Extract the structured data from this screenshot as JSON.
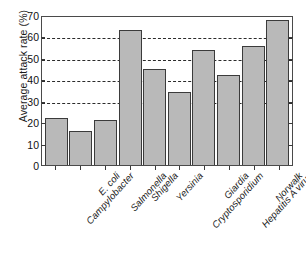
{
  "chart_data": {
    "type": "bar",
    "title": "",
    "xlabel": "",
    "ylabel": "Average attack rate (%)",
    "ylim": [
      0,
      70
    ],
    "yticks": [
      0,
      10,
      20,
      30,
      40,
      50,
      60,
      70
    ],
    "gridlines": [
      30,
      40,
      50,
      60
    ],
    "grid": true,
    "legend": "none",
    "bar_color": "#b9b9b9",
    "bar_edge_color": "#3b3b3b",
    "categories": [
      "Campylobacter",
      "E. coli",
      "Salmonella",
      "Shigella",
      "Yersinia",
      "Cryptosporidium",
      "Giardia",
      "Hepatitis A virus",
      "Norwalk",
      "Acuta gastroenteritis"
    ],
    "values": [
      22,
      16,
      21,
      63,
      45,
      34,
      53.5,
      42,
      55.5,
      67.5
    ]
  }
}
